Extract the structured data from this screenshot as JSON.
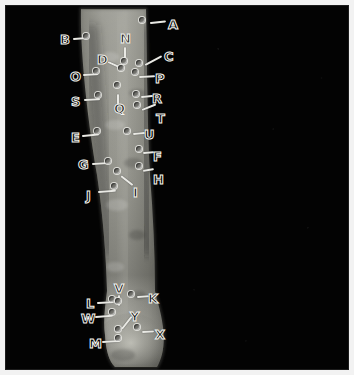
{
  "image": {
    "kind": "medical-annotated-photograph",
    "subject": "lower leg (shin and ankle) grayscale clinical photograph",
    "border_color": "#f2f2f2",
    "background_color": "#030303",
    "limb_fill_light": "#9a9a93",
    "limb_fill_mid": "#7d7d76",
    "limb_fill_dark": "#4a4a45",
    "marker_dot_color": "#6f6f6a",
    "leader_line_color": "#e9e9e4",
    "label_outline_color": "#f4f4ef"
  },
  "annotations": {
    "count": 25,
    "letters": [
      "A",
      "B",
      "C",
      "D",
      "E",
      "F",
      "G",
      "H",
      "I",
      "J",
      "K",
      "L",
      "M",
      "N",
      "O",
      "P",
      "Q",
      "R",
      "S",
      "T",
      "U",
      "V",
      "W",
      "X",
      "Y"
    ],
    "items": [
      {
        "id": "A",
        "label": "A",
        "letter_x": 168,
        "letter_y": 18,
        "dot_x": 142,
        "dot_y": 20,
        "lead_x": 150,
        "lead_y": 22,
        "lead_len": 16,
        "lead_angle": -6
      },
      {
        "id": "B",
        "label": "B",
        "letter_x": 60,
        "letter_y": 33,
        "dot_x": 86,
        "dot_y": 36,
        "lead_x": 73,
        "lead_y": 38,
        "lead_len": 15,
        "lead_angle": -4
      },
      {
        "id": "C",
        "label": "C",
        "letter_x": 164,
        "letter_y": 50,
        "dot_x": 139,
        "dot_y": 63,
        "lead_x": 145,
        "lead_y": 64,
        "lead_len": 19,
        "lead_angle": -28
      },
      {
        "id": "D",
        "label": "D",
        "letter_x": 97,
        "letter_y": 53,
        "dot_x": 121,
        "dot_y": 68,
        "lead_x": 108,
        "lead_y": 61,
        "lead_len": 17,
        "lead_angle": 24
      },
      {
        "id": "E",
        "label": "E",
        "letter_x": 71,
        "letter_y": 131,
        "dot_x": 97,
        "dot_y": 131,
        "lead_x": 82,
        "lead_y": 135,
        "lead_len": 17,
        "lead_angle": -5
      },
      {
        "id": "F",
        "label": "F",
        "letter_x": 153,
        "letter_y": 150,
        "dot_x": 139,
        "dot_y": 149,
        "lead_x": 143,
        "lead_y": 152,
        "lead_len": 11,
        "lead_angle": -4
      },
      {
        "id": "G",
        "label": "G",
        "letter_x": 78,
        "letter_y": 158,
        "dot_x": 108,
        "dot_y": 161,
        "lead_x": 92,
        "lead_y": 163,
        "lead_len": 18,
        "lead_angle": -3
      },
      {
        "id": "H",
        "label": "H",
        "letter_x": 153,
        "letter_y": 173,
        "dot_x": 139,
        "dot_y": 166,
        "lead_x": 143,
        "lead_y": 170,
        "lead_len": 11,
        "lead_angle": -10
      },
      {
        "id": "I",
        "label": "I",
        "letter_x": 133,
        "letter_y": 186,
        "dot_x": 117,
        "dot_y": 171,
        "lead_x": 121,
        "lead_y": 175,
        "lead_len": 15,
        "lead_angle": 38
      },
      {
        "id": "J",
        "label": "J",
        "letter_x": 86,
        "letter_y": 189,
        "dot_x": 114,
        "dot_y": 186,
        "lead_x": 98,
        "lead_y": 191,
        "lead_len": 18,
        "lead_angle": -4
      },
      {
        "id": "K",
        "label": "K",
        "letter_x": 148,
        "letter_y": 292,
        "dot_x": 131,
        "dot_y": 294,
        "lead_x": 137,
        "lead_y": 296,
        "lead_len": 12,
        "lead_angle": -4
      },
      {
        "id": "L",
        "label": "L",
        "letter_x": 86,
        "letter_y": 297,
        "dot_x": 112,
        "dot_y": 299,
        "lead_x": 97,
        "lead_y": 302,
        "lead_len": 16,
        "lead_angle": -3
      },
      {
        "id": "M",
        "label": "M",
        "letter_x": 89,
        "letter_y": 337,
        "dot_x": 118,
        "dot_y": 338,
        "lead_x": 102,
        "lead_y": 341,
        "lead_len": 18,
        "lead_angle": -3
      },
      {
        "id": "N",
        "label": "N",
        "letter_x": 120,
        "letter_y": 32,
        "dot_x": 124,
        "dot_y": 61,
        "lead_x": 125,
        "lead_y": 46,
        "lead_len": 16,
        "lead_angle": 90
      },
      {
        "id": "O",
        "label": "O",
        "letter_x": 70,
        "letter_y": 70,
        "dot_x": 96,
        "dot_y": 71,
        "lead_x": 83,
        "lead_y": 74,
        "lead_len": 15,
        "lead_angle": -3
      },
      {
        "id": "P",
        "label": "P",
        "letter_x": 155,
        "letter_y": 72,
        "dot_x": 135,
        "dot_y": 72,
        "lead_x": 139,
        "lead_y": 76,
        "lead_len": 16,
        "lead_angle": -3
      },
      {
        "id": "Q",
        "label": "Q",
        "letter_x": 114,
        "letter_y": 102,
        "dot_x": 117,
        "dot_y": 85,
        "lead_x": 118,
        "lead_y": 93,
        "lead_len": 12,
        "lead_angle": 90
      },
      {
        "id": "R",
        "label": "R",
        "letter_x": 152,
        "letter_y": 92,
        "dot_x": 136,
        "dot_y": 94,
        "lead_x": 141,
        "lead_y": 96,
        "lead_len": 12,
        "lead_angle": -5
      },
      {
        "id": "S",
        "label": "S",
        "letter_x": 71,
        "letter_y": 95,
        "dot_x": 98,
        "dot_y": 95,
        "lead_x": 84,
        "lead_y": 99,
        "lead_len": 16,
        "lead_angle": -3
      },
      {
        "id": "T",
        "label": "T",
        "letter_x": 156,
        "letter_y": 112,
        "dot_x": 137,
        "dot_y": 105,
        "lead_x": 142,
        "lead_y": 109,
        "lead_len": 15,
        "lead_angle": -22
      },
      {
        "id": "U",
        "label": "U",
        "letter_x": 144,
        "letter_y": 128,
        "dot_x": 127,
        "dot_y": 131,
        "lead_x": 133,
        "lead_y": 133,
        "lead_len": 12,
        "lead_angle": -5
      },
      {
        "id": "V",
        "label": "V",
        "letter_x": 114,
        "letter_y": 282,
        "dot_x": 118,
        "dot_y": 301,
        "lead_x": 119,
        "lead_y": 294,
        "lead_len": 11,
        "lead_angle": 90
      },
      {
        "id": "W",
        "label": "W",
        "letter_x": 81,
        "letter_y": 312,
        "dot_x": 112,
        "dot_y": 312,
        "lead_x": 95,
        "lead_y": 316,
        "lead_len": 18,
        "lead_angle": -4
      },
      {
        "id": "X",
        "label": "X",
        "letter_x": 155,
        "letter_y": 328,
        "dot_x": 137,
        "dot_y": 327,
        "lead_x": 142,
        "lead_y": 331,
        "lead_len": 12,
        "lead_angle": -3
      },
      {
        "id": "Y",
        "label": "Y",
        "letter_x": 130,
        "letter_y": 310,
        "dot_x": 118,
        "dot_y": 329,
        "lead_x": 122,
        "lead_y": 328,
        "lead_len": 16,
        "lead_angle": -52
      }
    ]
  }
}
